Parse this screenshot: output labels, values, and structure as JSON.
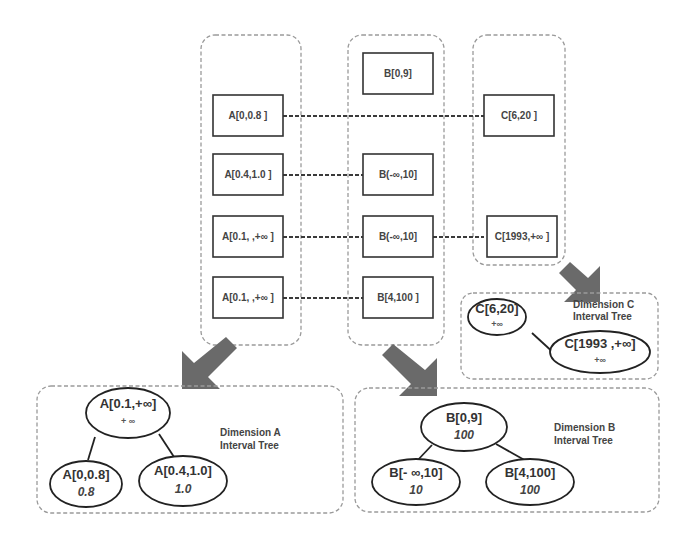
{
  "columns": {
    "A": {
      "items": [
        "A[0,0.8 ]",
        "A[0.4,1.0 ]",
        "A[0.1, ,+∞ ]",
        "A[0.1, ,+∞ ]"
      ]
    },
    "B": {
      "items": [
        "B[0,9]",
        "B(-∞,10]",
        "B(-∞,10]",
        "B[4,100 ]"
      ]
    },
    "C": {
      "items": [
        "C[6,20 ]",
        "C[1993,+∞ ]"
      ]
    }
  },
  "trees": {
    "A": {
      "title_line1": "Dimension A",
      "title_line2": "Interval Tree",
      "root": {
        "label": "A[0.1,+∞]",
        "value": "+ ∞"
      },
      "left": {
        "label": "A[0,0.8]",
        "value": "0.8"
      },
      "right": {
        "label": "A[0.4,1.0]",
        "value": "1.0"
      }
    },
    "B": {
      "title_line1": "Dimension B",
      "title_line2": "Interval Tree",
      "root": {
        "label": "B[0,9]",
        "value": "100"
      },
      "left": {
        "label": "B[- ∞,10]",
        "value": "10"
      },
      "right": {
        "label": "B[4,100]",
        "value": "100"
      }
    },
    "C": {
      "title_line1": "Dimension C",
      "title_line2": "Interval Tree",
      "root": {
        "label": "C[6,20]",
        "value": "+∞"
      },
      "right": {
        "label": "C[1993 ,+∞]",
        "value": "+∞"
      }
    }
  },
  "colors": {
    "outline": "#9a9a9a",
    "node_border": "#222222",
    "arrow": "#6a6a6a",
    "text": "#444444"
  }
}
